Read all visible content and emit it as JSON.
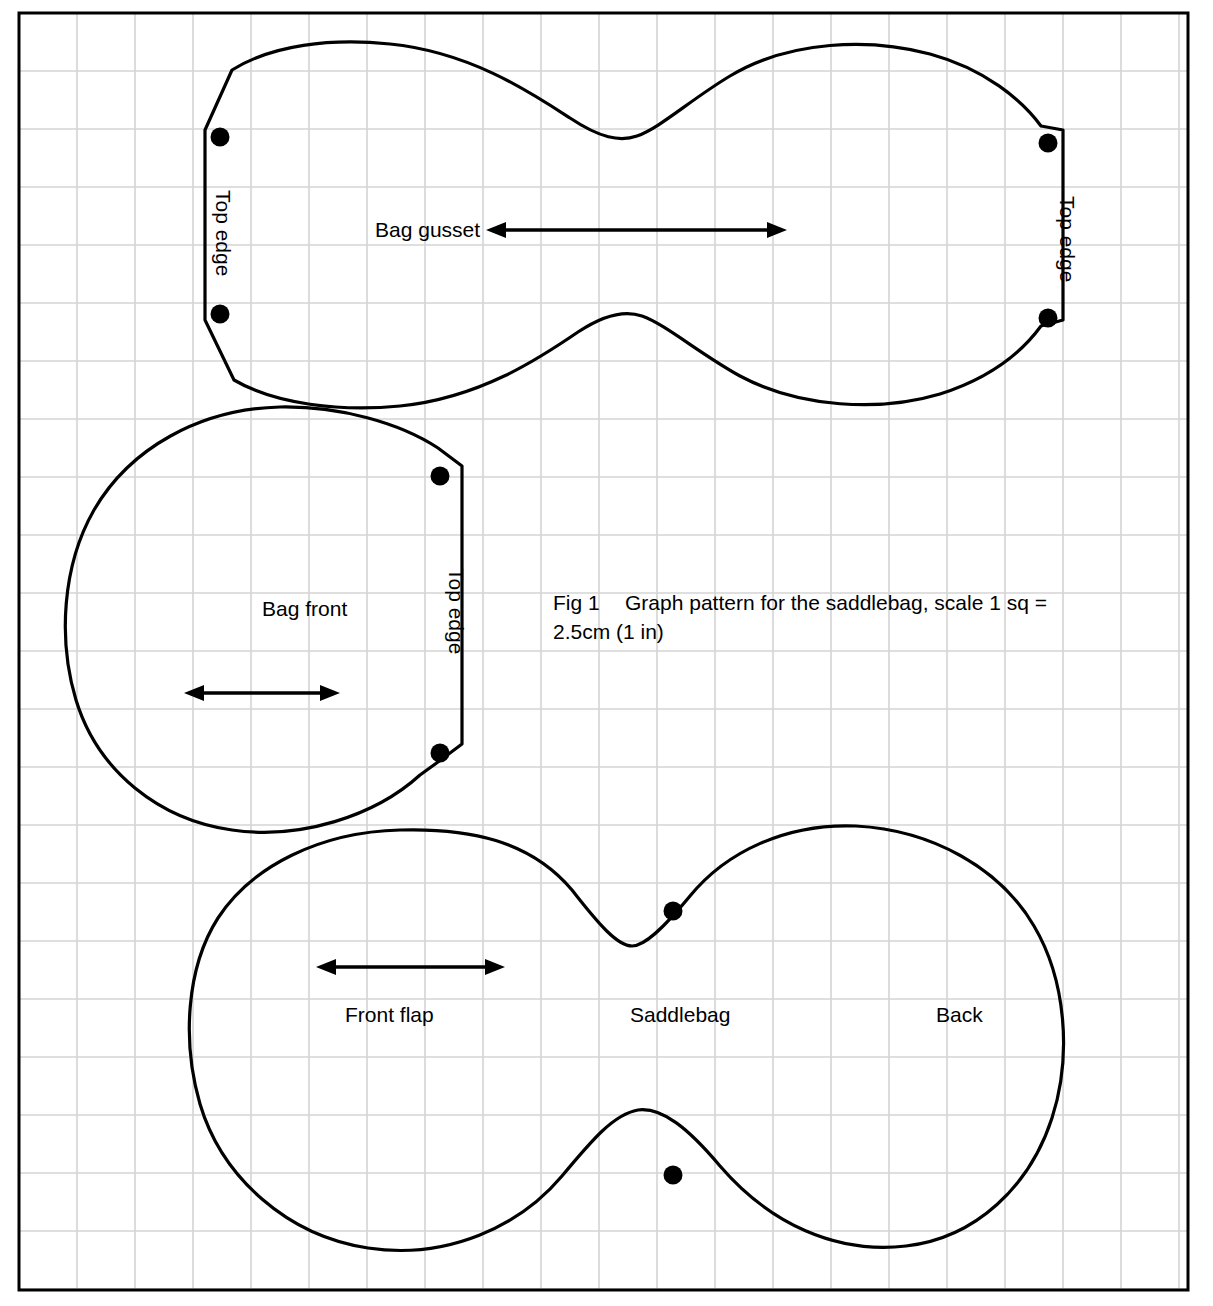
{
  "figure": {
    "caption_label": "Fig 1",
    "caption_text": "Graph pattern for the saddlebag, scale 1 sq =",
    "caption_text_line2": "2.5cm (1 in)",
    "scale_note": "1 sq = 2.5cm (1 in)"
  },
  "colors": {
    "outline": "#000000",
    "grid": "#d4d4d4",
    "frame": "#000000",
    "background": "#ffffff",
    "dot": "#000000"
  },
  "grid": {
    "square_px": 58,
    "square_value": "2.5cm (1 in)",
    "frame_left": 19,
    "frame_top": 13,
    "frame_right": 1188,
    "frame_bottom": 1290
  },
  "pieces": [
    {
      "id": "bag-gusset",
      "name": "Bag gusset",
      "label": "Bag gusset",
      "label_x": 375,
      "label_y": 231,
      "edge_labels": [
        {
          "text": "Top edge",
          "x": 216,
          "y": 190,
          "rotation": 90
        },
        {
          "text": "Top edge",
          "x": 1060,
          "y": 196,
          "rotation": 90
        }
      ],
      "dots": [
        {
          "x": 220,
          "y": 137
        },
        {
          "x": 220,
          "y": 314
        },
        {
          "x": 1048,
          "y": 143
        },
        {
          "x": 1048,
          "y": 318
        }
      ],
      "grain_arrow": {
        "x1": 488,
        "y1": 230,
        "x2": 785,
        "y2": 230
      }
    },
    {
      "id": "bag-front",
      "name": "Bag front",
      "label": "Bag front",
      "label_x": 262,
      "label_y": 610,
      "edge_labels": [
        {
          "text": "Top edge",
          "x": 449,
          "y": 568,
          "rotation": 90
        }
      ],
      "dots": [
        {
          "x": 440,
          "y": 476
        },
        {
          "x": 440,
          "y": 753
        }
      ],
      "grain_arrow": {
        "x1": 186,
        "y1": 693,
        "x2": 338,
        "y2": 693
      }
    },
    {
      "id": "saddlebag",
      "name": "Saddlebag",
      "labels": [
        {
          "text": "Front flap",
          "x": 345,
          "y": 1016
        },
        {
          "text": "Saddlebag",
          "x": 630,
          "y": 1016
        },
        {
          "text": "Back",
          "x": 936,
          "y": 1016
        }
      ],
      "dots": [
        {
          "x": 673,
          "y": 911
        },
        {
          "x": 673,
          "y": 1175
        }
      ],
      "grain_arrow": {
        "x1": 318,
        "y1": 967,
        "x2": 503,
        "y2": 967
      }
    }
  ]
}
